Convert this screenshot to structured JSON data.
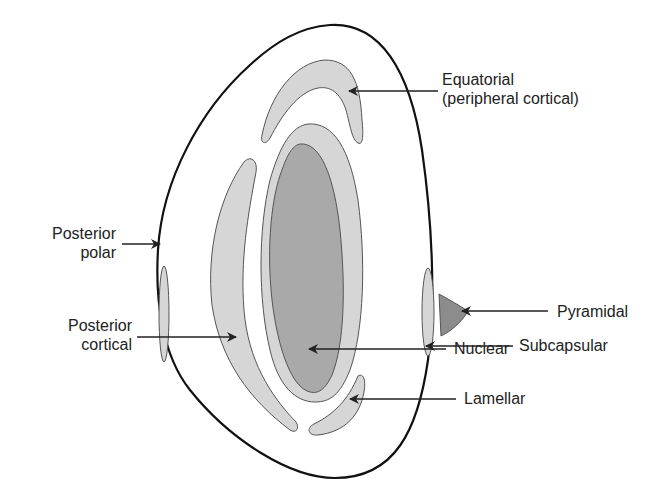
{
  "diagram": {
    "colors": {
      "outline": "#111111",
      "cortical_fill": "#d6d6d6",
      "nuclear_fill": "#a9a9a9",
      "pyramidal_fill": "#8c8c8c",
      "arrow": "#222222"
    },
    "labels": {
      "equatorial": {
        "line1": "Equatorial",
        "line2": "(peripheral cortical)"
      },
      "posterior_polar": {
        "line1": "Posterior",
        "line2": "polar"
      },
      "posterior_cortical": {
        "line1": "Posterior",
        "line2": "cortical"
      },
      "pyramidal": "Pyramidal",
      "subcapsular": "Subcapsular",
      "lamellar": "Lamellar",
      "nuclear": "Nuclear"
    }
  }
}
